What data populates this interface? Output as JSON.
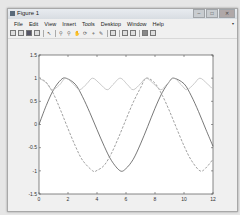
{
  "window": {
    "title": "Figure 1",
    "controls": {
      "minimize": "–",
      "maximize": "□",
      "close": "✕"
    }
  },
  "menu": {
    "items": [
      "File",
      "Edit",
      "View",
      "Insert",
      "Tools",
      "Desktop",
      "Window",
      "Help"
    ],
    "overflow_icon": "▾"
  },
  "toolbar": {
    "icons": [
      "new-figure-icon",
      "open-file-icon",
      "save-icon",
      "print-icon",
      "separator",
      "edit-plot-icon",
      "separator",
      "zoom-in-icon",
      "zoom-out-icon",
      "pan-icon",
      "rotate-3d-icon",
      "data-cursor-icon",
      "brush-icon",
      "separator",
      "link-plot-icon",
      "separator",
      "insert-colorbar-icon",
      "insert-legend-icon",
      "separator",
      "hide-plot-tools-icon",
      "show-plot-tools-icon"
    ]
  },
  "chart_data": {
    "type": "line",
    "title": "",
    "xlabel": "",
    "ylabel": "",
    "xlim": [
      0,
      12
    ],
    "ylim": [
      -1.5,
      1.5
    ],
    "xticks": [
      0,
      2,
      4,
      6,
      8,
      10,
      12
    ],
    "yticks": [
      -1.5,
      -1,
      -0.5,
      0,
      0.5,
      1,
      1.5
    ],
    "xtick_labels": [
      "0",
      "2",
      "4",
      "6",
      "8",
      "10",
      "12"
    ],
    "ytick_labels": [
      "-1.5",
      "-1",
      "-0.5",
      "0",
      "0.5",
      "1",
      "1.5"
    ],
    "grid": false,
    "legend": null,
    "series": [
      {
        "name": "solid (sin-like)",
        "style": "solid",
        "color": "#555555",
        "x": [
          0,
          0.5,
          1,
          1.5,
          1.85,
          2.5,
          3,
          3.5,
          4,
          4.5,
          5,
          5.6,
          6,
          6.5,
          7,
          7.5,
          8,
          8.5,
          9,
          9.3,
          10,
          10.5,
          11,
          11.5,
          12
        ],
        "y": [
          0,
          0.41,
          0.75,
          0.96,
          1.0,
          0.87,
          0.6,
          0.26,
          -0.11,
          -0.47,
          -0.78,
          -1.0,
          -0.95,
          -0.75,
          -0.42,
          -0.04,
          0.35,
          0.69,
          0.93,
          1.0,
          0.88,
          0.62,
          0.28,
          -0.1,
          -0.47
        ]
      },
      {
        "name": "dashed (cos-like)",
        "style": "dashed",
        "color": "#888888",
        "x": [
          0,
          0.5,
          1,
          1.5,
          2,
          2.5,
          3,
          3.7,
          4,
          4.5,
          5,
          5.5,
          6,
          6.5,
          7,
          7.4,
          8,
          8.5,
          9,
          9.5,
          10,
          10.5,
          11.1,
          11.5,
          12
        ],
        "y": [
          1.0,
          0.91,
          0.66,
          0.3,
          -0.09,
          -0.46,
          -0.77,
          -1.0,
          -0.99,
          -0.88,
          -0.62,
          -0.27,
          0.11,
          0.48,
          0.79,
          1.0,
          0.89,
          0.63,
          0.29,
          -0.09,
          -0.46,
          -0.77,
          -1.0,
          -0.94,
          -0.75
        ]
      },
      {
        "name": "light (envelope)",
        "style": "solid",
        "color": "#bbbbbb",
        "x": [
          0,
          0.5,
          0.9,
          1.4,
          1.85,
          2.4,
          2.8,
          3.3,
          3.7,
          4.2,
          4.7,
          5.1,
          5.6,
          6.1,
          6.5,
          7.0,
          7.4,
          7.9,
          8.4,
          8.8,
          9.3,
          9.8,
          10.2,
          10.7,
          11.1,
          11.6,
          12
        ],
        "y": [
          1.0,
          0.9,
          0.75,
          0.85,
          1.0,
          0.86,
          0.75,
          0.88,
          1.0,
          0.88,
          0.75,
          0.86,
          1.0,
          0.86,
          0.75,
          0.88,
          1.0,
          0.88,
          0.75,
          0.86,
          1.0,
          0.86,
          0.75,
          0.88,
          1.0,
          0.88,
          0.76
        ]
      }
    ]
  }
}
